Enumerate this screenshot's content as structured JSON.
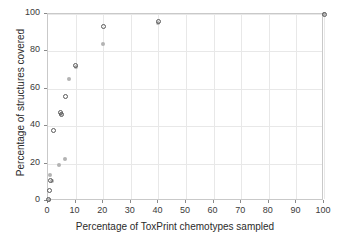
{
  "chart_data": {
    "type": "scatter",
    "title": "",
    "xlabel": "Percentage of ToxPrint chemotypes sampled",
    "ylabel": "Percentage of structures covered",
    "xlim": [
      0,
      100
    ],
    "ylim": [
      0,
      100
    ],
    "xticks": [
      0,
      10,
      20,
      30,
      40,
      50,
      60,
      70,
      80,
      90,
      100
    ],
    "yticks": [
      0,
      20,
      40,
      60,
      80,
      100
    ],
    "xticklabels": [
      "0",
      "10",
      "20",
      "30",
      "40",
      "50",
      "60",
      "70",
      "80",
      "90",
      "100"
    ],
    "yticklabels": [
      "0",
      "20",
      "40",
      "60",
      "80",
      "100"
    ],
    "grid": true,
    "legend": "none",
    "series": [
      {
        "name": "series-open-circles",
        "marker": "open-circle",
        "color": "#5a5a5a",
        "points": [
          {
            "x": 0.3,
            "y": 1.0
          },
          {
            "x": 0.5,
            "y": 5.5
          },
          {
            "x": 0.8,
            "y": 11.0
          },
          {
            "x": 2.0,
            "y": 37.5
          },
          {
            "x": 4.5,
            "y": 47.5
          },
          {
            "x": 5.0,
            "y": 46.0
          },
          {
            "x": 6.5,
            "y": 56.0
          },
          {
            "x": 10.0,
            "y": 72.5
          },
          {
            "x": 20.0,
            "y": 93.5
          },
          {
            "x": 40.0,
            "y": 96.0
          },
          {
            "x": 100.0,
            "y": 100.0
          }
        ]
      },
      {
        "name": "series-filled-dots",
        "marker": "filled-dot",
        "color": "#b3b3b3",
        "points": [
          {
            "x": 0.3,
            "y": 0.8
          },
          {
            "x": 0.8,
            "y": 14.0
          },
          {
            "x": 1.5,
            "y": 10.5
          },
          {
            "x": 4.0,
            "y": 19.5
          },
          {
            "x": 6.0,
            "y": 22.5
          },
          {
            "x": 4.8,
            "y": 46.5
          },
          {
            "x": 7.5,
            "y": 65.0
          },
          {
            "x": 10.0,
            "y": 71.5
          },
          {
            "x": 20.0,
            "y": 84.0
          },
          {
            "x": 40.0,
            "y": 95.0
          },
          {
            "x": 100.0,
            "y": 100.0
          }
        ]
      }
    ]
  },
  "colors": {
    "background": "#ffffff",
    "grid": "#e8e8e8",
    "axis": "#c9c9c9",
    "text": "#2b2b2b",
    "series_dark": "#5a5a5a",
    "series_light": "#b3b3b3"
  }
}
